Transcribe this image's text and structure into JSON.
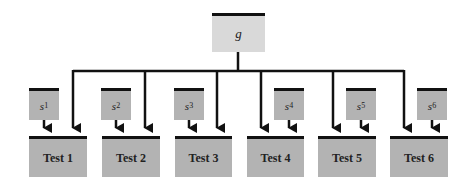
{
  "diagram": {
    "root": {
      "label": "g"
    },
    "specific_factors": [
      {
        "base": "s",
        "sub": "1"
      },
      {
        "base": "s",
        "sub": "2"
      },
      {
        "base": "s",
        "sub": "3"
      },
      {
        "base": "s",
        "sub": "4"
      },
      {
        "base": "s",
        "sub": "5"
      },
      {
        "base": "s",
        "sub": "6"
      }
    ],
    "tests": [
      {
        "label": "Test 1"
      },
      {
        "label": "Test 2"
      },
      {
        "label": "Test 3"
      },
      {
        "label": "Test 4"
      },
      {
        "label": "Test 5"
      },
      {
        "label": "Test 6"
      }
    ],
    "colors": {
      "root_fill": "#d9d9d9",
      "box_fill": "#b3b3b3",
      "line": "#111111"
    }
  }
}
